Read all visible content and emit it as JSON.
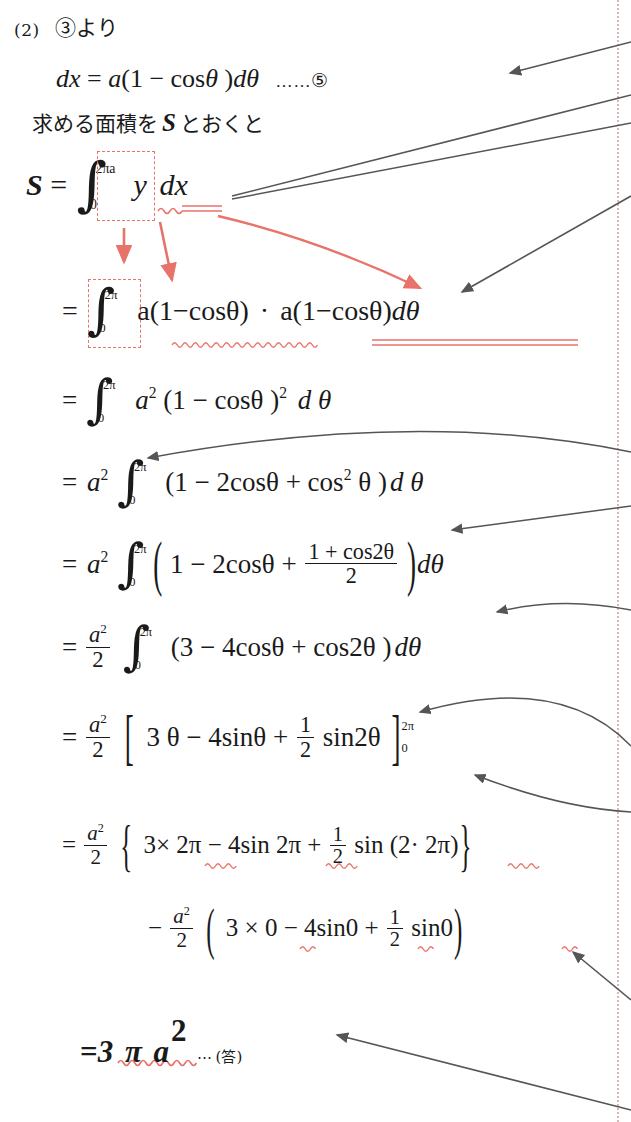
{
  "page": {
    "width": 631,
    "height": 1122,
    "background": "#ffffff",
    "margin_rule_color": "#d8a9a4",
    "ink_color": "#1a1a1a",
    "annotation_color": "#e8736a",
    "arrow_color": "#555555"
  },
  "header": {
    "problem_label": "(2)",
    "reference_text": "③より"
  },
  "lines": {
    "eq5": {
      "lhs": "dx",
      "eq": "=",
      "rhs_a": "a",
      "rhs_paren_open": "(",
      "rhs_one": "1",
      "rhs_minus": "−",
      "rhs_cos": "cos",
      "rhs_theta": "θ",
      "rhs_paren_close": ")",
      "rhs_dtheta_d": "d",
      "rhs_dtheta_t": "θ",
      "dots": "……",
      "tag": "⑤"
    },
    "jp_area": "求める面積を",
    "jp_area_var": "S",
    "jp_area_tail": "とおくと",
    "l1": {
      "lhs": "S",
      "eq": "=",
      "int_top": "2πa",
      "int_bot": "0",
      "body_y": "y",
      "body_dx": "dx"
    },
    "l2": {
      "eq": "=",
      "int_top": "2π",
      "int_bot": "0",
      "factor1": "a(1−cosθ)",
      "dot": "·",
      "factor2": "a(1−cosθ)",
      "dtheta": "dθ"
    },
    "l3": {
      "eq": "=",
      "int_top": "2π",
      "int_bot": "0",
      "a": "a",
      "a_pow": "2",
      "body": "(1 − cosθ )",
      "body_pow": "2",
      "dtheta": "d θ"
    },
    "l4": {
      "eq": "=",
      "a": "a",
      "a_pow": "2",
      "int_top": "2π",
      "int_bot": "0",
      "body": "(1 − 2cosθ + cos",
      "cos_pow": "2",
      "body_tail": "θ )",
      "dtheta": "d θ"
    },
    "l5": {
      "eq": "=",
      "a": "a",
      "a_pow": "2",
      "int_top": "2π",
      "int_bot": "0",
      "head": "1 − 2cosθ +",
      "frac_num": "1 + cos2θ",
      "frac_den": "2",
      "dtheta": "dθ"
    },
    "l6": {
      "eq": "=",
      "frac_num": "a",
      "frac_num_pow": "2",
      "frac_den": "2",
      "int_top": "2π",
      "int_bot": "0",
      "body": "(3 − 4cosθ + cos2θ )",
      "dtheta": "dθ"
    },
    "l7": {
      "eq": "=",
      "frac_num": "a",
      "frac_num_pow": "2",
      "frac_den": "2",
      "bracket_open": "[",
      "body_head": "3 θ − 4sinθ +",
      "half_num": "1",
      "half_den": "2",
      "body_tail": "sin2θ",
      "bracket_close": "]",
      "lim_top": "2π",
      "lim_bot": "0"
    },
    "l8": {
      "eq": "=",
      "frac_num": "a",
      "frac_num_pow": "2",
      "frac_den": "2",
      "brace_open": "{",
      "t1": "3× 2π",
      "t2": "− 4sin 2π",
      "t3_plus": "+",
      "half_num": "1",
      "half_den": "2",
      "t4": "sin (2· 2π)",
      "brace_close": "}"
    },
    "l9": {
      "minus": "−",
      "frac_num": "a",
      "frac_num_pow": "2",
      "frac_den": "2",
      "paren_open": "(",
      "t1": "3 × 0",
      "t2": "− 4sin0",
      "t3_plus": "+",
      "half_num": "1",
      "half_den": "2",
      "t4": "sin0",
      "paren_close": ")"
    },
    "answer": {
      "eq": "=",
      "value": "3 π a",
      "value_pow": "2",
      "dots": "⋯",
      "tag": "(答)"
    }
  },
  "annotations": {
    "red_dashed_boxes": 2,
    "red_arrows": 3,
    "red_squiggles": 4,
    "red_double_underlines": 2,
    "gray_arrows": 7
  }
}
